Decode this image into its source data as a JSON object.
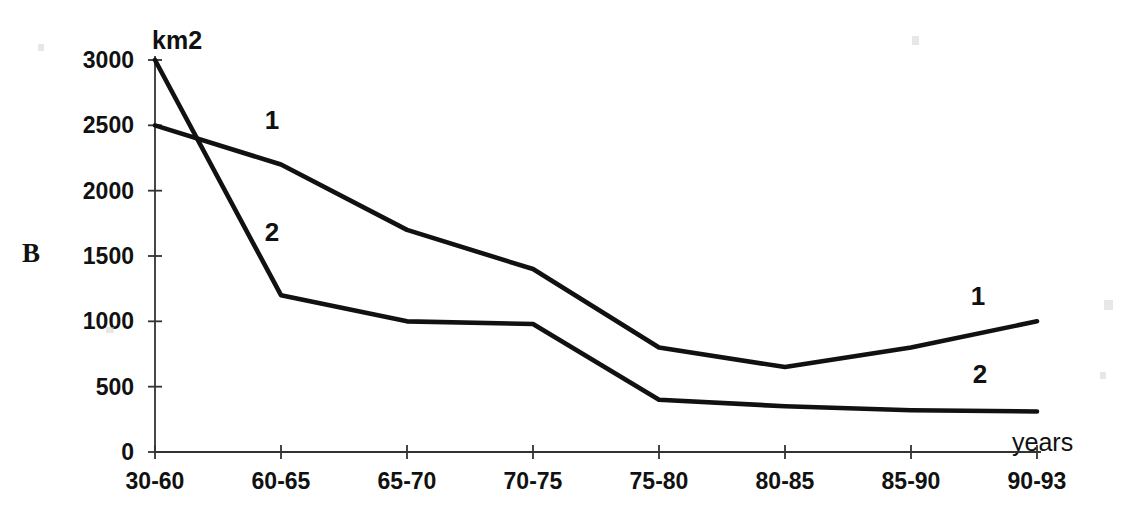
{
  "panel": {
    "letter": "B"
  },
  "axes": {
    "y_unit_label": "km2",
    "x_title": "years",
    "y_ticks": [
      "0",
      "500",
      "1000",
      "1500",
      "2000",
      "2500",
      "3000"
    ],
    "x_ticks": [
      "30-60",
      "60-65",
      "65-70",
      "70-75",
      "75-80",
      "80-85",
      "85-90",
      "90-93"
    ]
  },
  "series_labels": [
    {
      "text": "1",
      "note": "upper-left label for series 1"
    },
    {
      "text": "2",
      "note": "lower-left label for series 2"
    },
    {
      "text": "1",
      "note": "right-side label for series 1"
    },
    {
      "text": "2",
      "note": "right-side label for series 2"
    }
  ],
  "colors": {
    "line": "#111111",
    "axis": "#333333",
    "background": "#ffffff"
  },
  "chart_data": {
    "type": "line",
    "title": "",
    "xlabel": "years",
    "ylabel": "km2",
    "ylim": [
      0,
      3000
    ],
    "grid": false,
    "legend": "inline-labels",
    "categories": [
      "30-60",
      "60-65",
      "65-70",
      "70-75",
      "75-80",
      "80-85",
      "85-90",
      "90-93"
    ],
    "series": [
      {
        "name": "1",
        "values": [
          2500,
          2200,
          1700,
          1400,
          800,
          650,
          800,
          1000
        ]
      },
      {
        "name": "2",
        "values": [
          3000,
          1200,
          1000,
          980,
          400,
          350,
          320,
          310
        ]
      }
    ]
  }
}
